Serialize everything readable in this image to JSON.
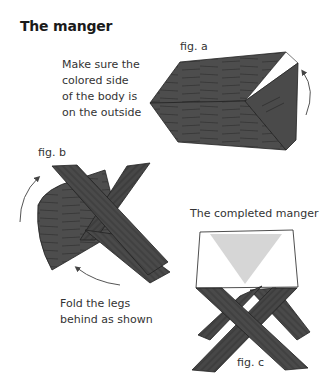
{
  "page": {
    "title": "The manger"
  },
  "figures": {
    "a": {
      "label": "fig. a",
      "caption_lines": [
        "Make sure the",
        "colored side",
        "of the body is",
        "on the outside"
      ]
    },
    "b": {
      "label": "fig. b",
      "caption_lines": [
        "Fold the legs",
        "behind as shown"
      ]
    },
    "c": {
      "label": "fig. c",
      "heading": "The completed manger"
    }
  },
  "colors": {
    "wood": "#4a4a4a",
    "wood_dark": "#2e2e2e",
    "grain": "#2a2a2a",
    "paper": "#ffffff",
    "inner_fold": "#d9d9d9",
    "arrow": "#555555"
  }
}
